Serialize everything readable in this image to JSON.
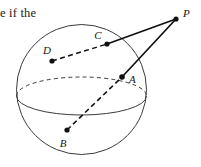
{
  "page": {
    "width": 201,
    "height": 167,
    "background_color": "#ffffff"
  },
  "body_text": {
    "fragment": "e if the"
  },
  "figure": {
    "stroke_color": "#3a3a3a",
    "line_color": "#101010",
    "dot_color": "#101010",
    "sphere": {
      "label": "sphere-outline",
      "center_x": 81.5,
      "center_y": 89.5,
      "radius": 65,
      "equator_rx": 65,
      "equator_ry": 19,
      "equator_cy": 96,
      "front_arc_style": "solid",
      "back_arc_style": "dashed"
    },
    "points": [
      {
        "id": "P",
        "label": "P",
        "x": 176,
        "y": 19,
        "label_x": 183,
        "label_y": 17,
        "dot": true
      },
      {
        "id": "C",
        "label": "C",
        "x": 107,
        "y": 44,
        "label_x": 98,
        "label_y": 39,
        "dot": true
      },
      {
        "id": "D",
        "label": "D",
        "x": 52,
        "y": 61,
        "label_x": 47,
        "label_y": 54,
        "dot": true
      },
      {
        "id": "A",
        "label": "A",
        "x": 122,
        "y": 77,
        "label_x": 129,
        "label_y": 83,
        "dot": true
      },
      {
        "id": "B",
        "label": "B",
        "x": 67,
        "y": 130,
        "label_x": 63,
        "label_y": 147,
        "dot": true
      }
    ],
    "segments": [
      {
        "id": "PC",
        "from": "P",
        "to": "C",
        "style": "solid",
        "label": "segment-p-c"
      },
      {
        "id": "PA",
        "from": "P",
        "to": "A",
        "style": "solid",
        "label": "segment-p-a"
      },
      {
        "id": "DC",
        "from": "D",
        "to": "C",
        "style": "dashed",
        "label": "chord-d-c"
      },
      {
        "id": "BA",
        "from": "B",
        "to": "A",
        "style": "dashed",
        "label": "chord-b-a"
      }
    ]
  }
}
